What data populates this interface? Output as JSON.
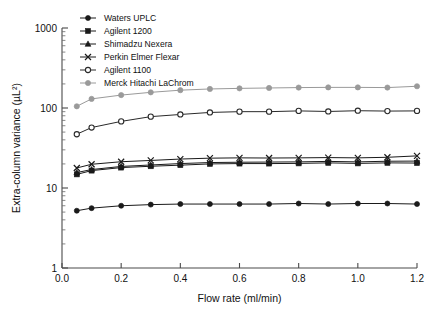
{
  "chart_data": {
    "type": "line",
    "title": "",
    "xlabel": "Flow rate (ml/min)",
    "ylabel": "Extra-column variance (µL²)",
    "xlim": [
      0.0,
      1.2
    ],
    "ylim": [
      1,
      1000
    ],
    "yscale": "log",
    "grid": false,
    "legend_position": "top-left",
    "x_ticks": [
      "0.0",
      "0.2",
      "0.4",
      "0.6",
      "0.8",
      "1.0",
      "1.2"
    ],
    "x_tick_values": [
      0.0,
      0.2,
      0.4,
      0.6,
      0.8,
      1.0,
      1.2
    ],
    "y_ticks": [
      "1",
      "10",
      "100",
      "1000"
    ],
    "y_tick_values": [
      1,
      10,
      100,
      1000
    ],
    "x": [
      0.05,
      0.1,
      0.2,
      0.3,
      0.4,
      0.5,
      0.6,
      0.7,
      0.8,
      0.9,
      1.0,
      1.1,
      1.2
    ],
    "series": [
      {
        "name": "Waters UPLC",
        "marker": "filled-circle",
        "color": "#1a1a1a",
        "values": [
          5.2,
          5.6,
          6.0,
          6.2,
          6.3,
          6.3,
          6.3,
          6.3,
          6.4,
          6.3,
          6.4,
          6.4,
          6.3
        ]
      },
      {
        "name": "Agilent 1200",
        "marker": "filled-square",
        "color": "#1a1a1a",
        "values": [
          14.8,
          16.5,
          18.0,
          18.7,
          19.3,
          20.0,
          20.2,
          20.2,
          20.3,
          20.6,
          20.3,
          20.6,
          20.5
        ]
      },
      {
        "name": "Shimadzu Nexera",
        "marker": "filled-triangle",
        "color": "#1a1a1a",
        "values": [
          15.6,
          17.0,
          18.6,
          19.4,
          20.2,
          20.8,
          21.0,
          21.1,
          21.2,
          21.5,
          21.2,
          21.6,
          21.7
        ]
      },
      {
        "name": "Perkin Elmer Flexar",
        "marker": "cross-x",
        "color": "#1a1a1a",
        "values": [
          17.8,
          19.8,
          21.3,
          22.1,
          23.0,
          23.6,
          23.8,
          23.7,
          23.8,
          24.0,
          23.8,
          24.2,
          25.2
        ]
      },
      {
        "name": "Agilent 1100",
        "marker": "open-circle",
        "color": "#2a2a2a",
        "values": [
          47.0,
          57.0,
          68.0,
          78.0,
          83.0,
          88.0,
          90.0,
          90.0,
          92.0,
          90.5,
          92.5,
          91.5,
          92.0
        ]
      },
      {
        "name": "Merck Hitachi LaChrom",
        "marker": "gray-circle",
        "color": "#9a9a9a",
        "values": [
          105.0,
          130.0,
          145.0,
          157.0,
          167.0,
          173.0,
          176.0,
          178.0,
          180.0,
          181.0,
          181.0,
          180.0,
          187.0
        ]
      }
    ]
  }
}
